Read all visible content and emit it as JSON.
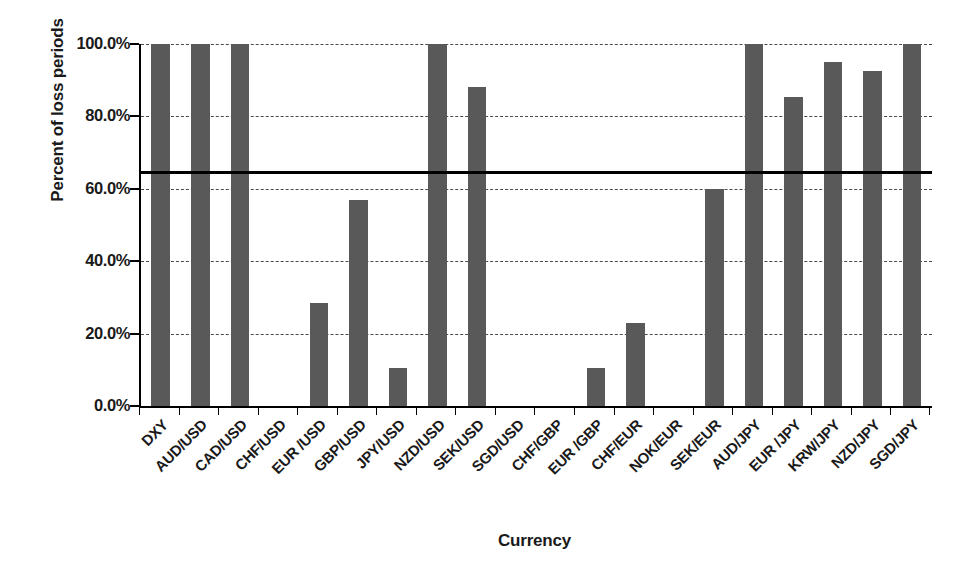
{
  "chart_data": {
    "type": "bar",
    "title": "",
    "xlabel": "Currency",
    "ylabel": "Percent of loss periods",
    "ylim": [
      0,
      100
    ],
    "grid": true,
    "legend": "none",
    "y_tick_labels": [
      "100.0%",
      "80.0%",
      "60.0%",
      "40.0%",
      "20.0%",
      "0.0%"
    ],
    "y_tick_values": [
      100,
      80,
      60,
      40,
      20,
      0
    ],
    "categories": [
      "DXY",
      "AUD/USD",
      "CAD/USD",
      "CHF/USD",
      "EUR /USD",
      "GBP/USD",
      "JPY/USD",
      "NZD/USD",
      "SEK/USD",
      "SGD/USD",
      "CHF/GBP",
      "EUR /GBP",
      "CHF/EUR",
      "NOK/EUR",
      "SEK/EUR",
      "AUD/JPY",
      "EUR /JPY",
      "KRW/JPY",
      "NZD/JPY",
      "SGD/JPY"
    ],
    "values": [
      100.0,
      100.0,
      100.0,
      0.0,
      28.5,
      57.0,
      10.5,
      100.0,
      88.0,
      0.0,
      0.0,
      10.5,
      23.0,
      0.0,
      60.0,
      100.0,
      85.5,
      95.0,
      92.5,
      100.0
    ],
    "reference_line": {
      "value": 65.0,
      "label": ""
    },
    "colors": {
      "bar": "#595959",
      "reference_line": "#000000",
      "gridline": "#2b2b2b",
      "axis": "#000000",
      "background": "#ffffff",
      "text": "#1a1a1a"
    }
  }
}
